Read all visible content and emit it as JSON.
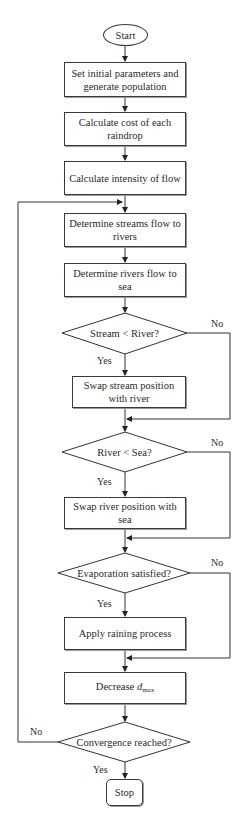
{
  "flowchart": {
    "start": "Start",
    "stop": "Stop",
    "steps": [
      {
        "id": "init",
        "text": "Set initial parameters and generate population"
      },
      {
        "id": "cost",
        "text": "Calculate cost of each raindrop"
      },
      {
        "id": "intensity",
        "text": "Calculate intensity of flow"
      },
      {
        "id": "streams",
        "text": "Determine streams flow to rivers"
      },
      {
        "id": "rivers",
        "text": "Determine rivers flow to sea"
      },
      {
        "id": "swap_stream",
        "text": "Swap stream position with river"
      },
      {
        "id": "swap_river",
        "text": "Swap river position with sea"
      },
      {
        "id": "raining",
        "text": "Apply raining process"
      },
      {
        "id": "decrease",
        "text_prefix": "Decrease ",
        "var": "d",
        "sub": "max"
      }
    ],
    "decisions": [
      {
        "id": "stream_river",
        "text": "Stream < River?",
        "yes": "Yes",
        "no": "No"
      },
      {
        "id": "river_sea",
        "text": "River < Sea?",
        "yes": "Yes",
        "no": "No"
      },
      {
        "id": "evaporation",
        "text": "Evaporation satisfied?",
        "yes": "Yes",
        "no": "No"
      },
      {
        "id": "convergence",
        "text": "Convergence reached?",
        "yes": "Yes",
        "no": "No"
      }
    ]
  }
}
